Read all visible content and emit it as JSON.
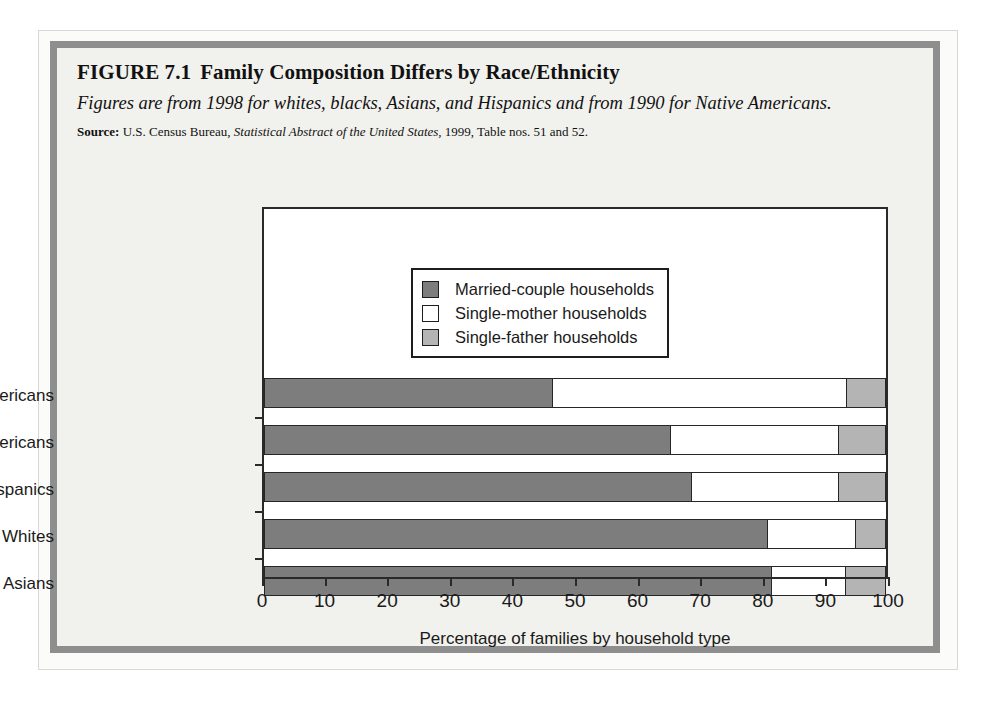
{
  "figure": {
    "label": "FIGURE 7.1",
    "title": "Family Composition Differs by Race/Ethnicity",
    "subtitle": "Figures are from 1998 for whites, blacks, Asians, and Hispanics and from 1990 for Native Americans.",
    "source_label": "Source:",
    "source_part1": "U.S. Census Bureau,",
    "source_italic": "Statistical Abstract of the United States,",
    "source_part2": "1999, Table nos. 51 and 52."
  },
  "chart_data": {
    "type": "bar",
    "orientation": "horizontal",
    "stacked": true,
    "title": "Family Composition Differs by Race/Ethnicity",
    "xlabel": "Percentage of families by household type",
    "ylabel": "",
    "xlim": [
      0,
      100
    ],
    "xticks": [
      0,
      10,
      20,
      30,
      40,
      50,
      60,
      70,
      80,
      90,
      100
    ],
    "grid": false,
    "legend_position": "inside-top-center",
    "categories": [
      "African Americans",
      "Native Americans",
      "Hispanics",
      "Whites",
      "Asians"
    ],
    "series": [
      {
        "name": "Married-couple households",
        "color": "#7d7d7d",
        "values": [
          46.5,
          65.5,
          68.8,
          81.0,
          81.6
        ]
      },
      {
        "name": "Single-mother households",
        "color": "#ffffff",
        "values": [
          47.2,
          26.9,
          23.7,
          14.1,
          11.9
        ]
      },
      {
        "name": "Single-father households",
        "color": "#b4b4b4",
        "values": [
          6.3,
          7.6,
          7.5,
          4.9,
          6.5
        ]
      }
    ],
    "cumulative_boundaries": [
      [
        46.5,
        93.7,
        100
      ],
      [
        65.5,
        92.4,
        100
      ],
      [
        68.8,
        92.5,
        100
      ],
      [
        81.0,
        95.1,
        100
      ],
      [
        81.6,
        93.5,
        100
      ]
    ]
  },
  "legend": {
    "items": [
      {
        "label": "Married-couple households",
        "swatch": "married-swatch"
      },
      {
        "label": "Single-mother households",
        "swatch": "mother-swatch"
      },
      {
        "label": "Single-father households",
        "swatch": "father-swatch"
      }
    ]
  },
  "colors": {
    "married": "#7d7d7d",
    "single_mother": "#ffffff",
    "single_father": "#b4b4b4",
    "frame": "#8e8e8e",
    "panel_background": "#f1f1ed",
    "axis": "#2a2a2a"
  }
}
